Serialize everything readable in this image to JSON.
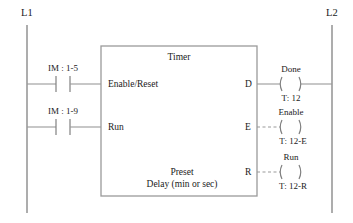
{
  "diagram": {
    "type": "plc-ladder-logic-timer",
    "line_color": "#888888",
    "text_color": "#1a1a1a",
    "background": "#ffffff"
  },
  "rails": {
    "left": {
      "label": "L1",
      "x": 27,
      "y_top": 25,
      "y_bottom": 213
    },
    "right": {
      "label": "L2",
      "x": 332,
      "y_top": 25,
      "y_bottom": 213
    }
  },
  "contacts": [
    {
      "name": "enable-reset-contact",
      "label": "IM : 1-5",
      "kind": "normally-open",
      "rung_y": 84,
      "x_center": 63
    },
    {
      "name": "run-contact",
      "label": "IM : 1-9",
      "kind": "normally-open",
      "rung_y": 127,
      "x_center": 63
    }
  ],
  "block": {
    "title": "Timer",
    "x": 101,
    "y": 46,
    "w": 156,
    "h": 150,
    "inputs": [
      {
        "label": "Enable/Reset",
        "y": 87
      },
      {
        "label": "Run",
        "y": 130
      }
    ],
    "outputs": [
      {
        "label": "D",
        "y": 87,
        "link": "solid"
      },
      {
        "label": "E",
        "y": 130,
        "link": "dashed"
      },
      {
        "label": "R",
        "y": 175,
        "link": "dashed"
      }
    ],
    "preset": {
      "line1": "Preset",
      "line2": "Delay (min or sec)"
    }
  },
  "coils": [
    {
      "name": "done-coil",
      "label": "Done",
      "address": "T: 12",
      "y": 87,
      "x_center": 290,
      "link": "solid",
      "to_rail": true
    },
    {
      "name": "enable-coil",
      "label": "Enable",
      "address": "T: 12-E",
      "y": 130,
      "x_center": 290,
      "link": "dashed",
      "to_rail": false
    },
    {
      "name": "run-coil",
      "label": "Run",
      "address": "T: 12-R",
      "y": 175,
      "x_center": 290,
      "link": "dashed",
      "to_rail": false
    }
  ]
}
